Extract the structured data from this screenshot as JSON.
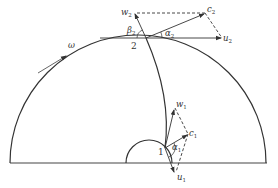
{
  "diagram": {
    "colors": {
      "stroke": "#333333",
      "background": "#ffffff"
    },
    "rotation": {
      "symbol": "ω",
      "label": "ω"
    },
    "points": [
      {
        "id": "2",
        "label": "2",
        "role": "outlet"
      },
      {
        "id": "1",
        "label": "1",
        "role": "inlet"
      }
    ],
    "outlet_triangle": {
      "w": {
        "base": "w",
        "sub": "2"
      },
      "c": {
        "base": "c",
        "sub": "2"
      },
      "u": {
        "base": "u",
        "sub": "2"
      },
      "alpha": {
        "base": "α",
        "sub": "2"
      },
      "beta": {
        "base": "β",
        "sub": "2"
      }
    },
    "inlet_triangle": {
      "w": {
        "base": "w",
        "sub": "1"
      },
      "c": {
        "base": "c",
        "sub": "1"
      },
      "u": {
        "base": "u",
        "sub": "1"
      },
      "alpha": {
        "base": "α",
        "sub": "1"
      }
    }
  }
}
